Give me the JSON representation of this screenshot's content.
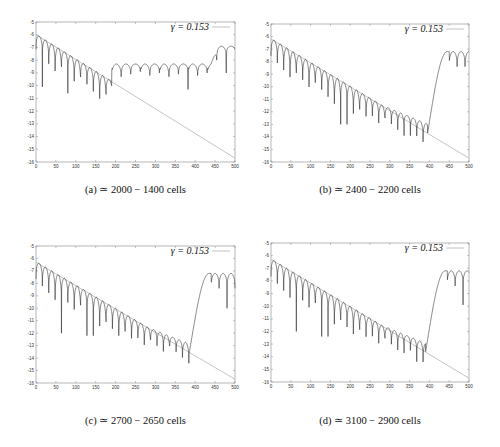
{
  "chart_data": [
    {
      "type": "line",
      "panel": "a",
      "caption": "(a) ≃ 2000 − 1400 cells",
      "legend": "γ = 0.153",
      "xlabel": "",
      "ylabel": "",
      "xlim": [
        0,
        500
      ],
      "ylim": [
        -16,
        -5
      ],
      "xticks": [
        0,
        50,
        100,
        150,
        200,
        250,
        300,
        350,
        400,
        450,
        500
      ],
      "yticks": [
        -5,
        -6,
        -7,
        -8,
        -9,
        -10,
        -11,
        -12,
        -13,
        -14,
        -15,
        -16
      ],
      "grid": false,
      "reference_line": {
        "x": [
          0,
          500
        ],
        "y": [
          -6.0,
          -15.7
        ]
      },
      "series": {
        "name": "signal",
        "decay_until_x": 190,
        "dip_period": 16,
        "plateau_level": -8.6,
        "plateau_dip_period": 24,
        "deep_dips": [
          {
            "x": 15,
            "y": -10.1
          },
          {
            "x": 80,
            "y": -10.6
          },
          {
            "x": 165,
            "y": -10.8
          },
          {
            "x": 375,
            "y": -10.3
          },
          {
            "x": 480,
            "y": -9.0
          }
        ],
        "end_rise": {
          "start_x": 440,
          "level": -7.2
        }
      }
    },
    {
      "type": "line",
      "panel": "b",
      "caption": "(b) ≃ 2400 − 2200 cells",
      "legend": "γ = 0.153",
      "xlabel": "",
      "ylabel": "",
      "xlim": [
        0,
        500
      ],
      "ylim": [
        -16,
        -5
      ],
      "xticks": [
        0,
        50,
        100,
        150,
        200,
        250,
        300,
        350,
        400,
        450,
        500
      ],
      "yticks": [
        -5,
        -6,
        -7,
        -8,
        -9,
        -10,
        -11,
        -12,
        -13,
        -14,
        -15,
        -16
      ],
      "grid": false,
      "reference_line": {
        "x": [
          0,
          500
        ],
        "y": [
          -6.2,
          -15.7
        ]
      },
      "series": {
        "name": "signal",
        "decay_until_x": 395,
        "dip_period": 16,
        "rise_x": 400,
        "plateau_level": -7.2,
        "deep_dips": [
          {
            "x": 185,
            "y": -13.0
          },
          {
            "x": 345,
            "y": -13.9
          },
          {
            "x": 390,
            "y": -12.8
          },
          {
            "x": 425,
            "y": -10.6
          },
          {
            "x": 480,
            "y": -9.6
          }
        ]
      }
    },
    {
      "type": "line",
      "panel": "c",
      "caption": "(c) ≃ 2700 − 2650 cells",
      "legend": "γ = 0.153",
      "xlabel": "",
      "ylabel": "",
      "xlim": [
        0,
        500
      ],
      "ylim": [
        -16,
        -5
      ],
      "xticks": [
        0,
        50,
        100,
        150,
        200,
        250,
        300,
        350,
        400,
        450,
        500
      ],
      "yticks": [
        -5,
        -6,
        -7,
        -8,
        -9,
        -10,
        -11,
        -12,
        -13,
        -14,
        -15,
        -16
      ],
      "grid": false,
      "reference_line": {
        "x": [
          0,
          500
        ],
        "y": [
          -6.3,
          -15.7
        ]
      },
      "series": {
        "name": "signal",
        "decay_until_x": 385,
        "dip_period": 16,
        "rise_x": 390,
        "plateau_level": -7.2,
        "deep_dips": [
          {
            "x": 65,
            "y": -12.0
          },
          {
            "x": 135,
            "y": -12.2
          },
          {
            "x": 335,
            "y": -13.0
          },
          {
            "x": 445,
            "y": -10.8
          },
          {
            "x": 485,
            "y": -10.0
          }
        ]
      }
    },
    {
      "type": "line",
      "panel": "d",
      "caption": "(d) ≃ 3100 − 2900 cells",
      "legend": "γ = 0.153",
      "xlabel": "",
      "ylabel": "",
      "xlim": [
        0,
        500
      ],
      "ylim": [
        -16,
        -5
      ],
      "xticks": [
        0,
        50,
        100,
        150,
        200,
        250,
        300,
        350,
        400,
        450,
        500
      ],
      "yticks": [
        -5,
        -6,
        -7,
        -8,
        -9,
        -10,
        -11,
        -12,
        -13,
        -14,
        -15,
        -16
      ],
      "grid": false,
      "reference_line": {
        "x": [
          0,
          500
        ],
        "y": [
          -6.3,
          -15.7
        ]
      },
      "series": {
        "name": "signal",
        "decay_until_x": 390,
        "dip_period": 16,
        "rise_x": 395,
        "plateau_level": -7.2,
        "deep_dips": [
          {
            "x": 65,
            "y": -12.0
          },
          {
            "x": 135,
            "y": -12.4
          },
          {
            "x": 330,
            "y": -13.7
          },
          {
            "x": 370,
            "y": -14.4
          },
          {
            "x": 445,
            "y": -10.7
          },
          {
            "x": 485,
            "y": -9.9
          }
        ]
      }
    }
  ],
  "panels": [
    {
      "id": "a",
      "caption": "(a) ≃ 2000 − 1400 cells",
      "legend": "γ = 0.153"
    },
    {
      "id": "b",
      "caption": "(b) ≃ 2400 − 2200 cells",
      "legend": "γ = 0.153"
    },
    {
      "id": "c",
      "caption": "(c) ≃ 2700 − 2650 cells",
      "legend": "γ = 0.153"
    },
    {
      "id": "d",
      "caption": "(d) ≃ 3100 − 2900 cells",
      "legend": "γ = 0.153"
    }
  ],
  "colors": {
    "curve": "#222222",
    "reference": "#aaaaaa",
    "frame": "#888888"
  }
}
